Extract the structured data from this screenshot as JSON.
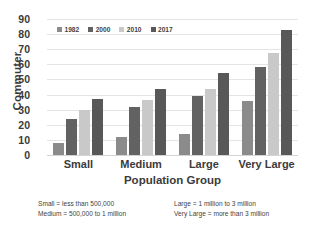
{
  "chart_data": {
    "type": "bar",
    "title": "",
    "xlabel": "Population Group",
    "ylabel": "Commuter",
    "categories": [
      "Small",
      "Medium",
      "Large",
      "Very Large"
    ],
    "ylim": [
      0,
      90
    ],
    "ytick_step": 10,
    "yticks": [
      90,
      80,
      70,
      60,
      50,
      40,
      30,
      20,
      10,
      0
    ],
    "grid": true,
    "legend_position": "top-left",
    "series": [
      {
        "name": "1982",
        "color": "#8b8b8b",
        "values": [
          8,
          12,
          14,
          36
        ]
      },
      {
        "name": "2000",
        "color": "#626262",
        "values": [
          24,
          32,
          39,
          58
        ]
      },
      {
        "name": "2010",
        "color": "#c9c9c9",
        "values": [
          30,
          36.5,
          43.5,
          67.5
        ]
      },
      {
        "name": "2017",
        "color": "#585858",
        "values": [
          37,
          44,
          54,
          83
        ]
      }
    ],
    "annotations": [
      "Small = less than 500,000",
      "Medium = 500,000 to 1 million",
      "Large = 1 million to 3 million",
      "Very Large = more than 3 million"
    ]
  },
  "notes": {
    "left": [
      "Small = less than 500,000",
      "Medium = 500,000 to 1 million"
    ],
    "right": [
      "Large = 1 million to 3 million",
      "Very Large = more than 3 million"
    ]
  }
}
